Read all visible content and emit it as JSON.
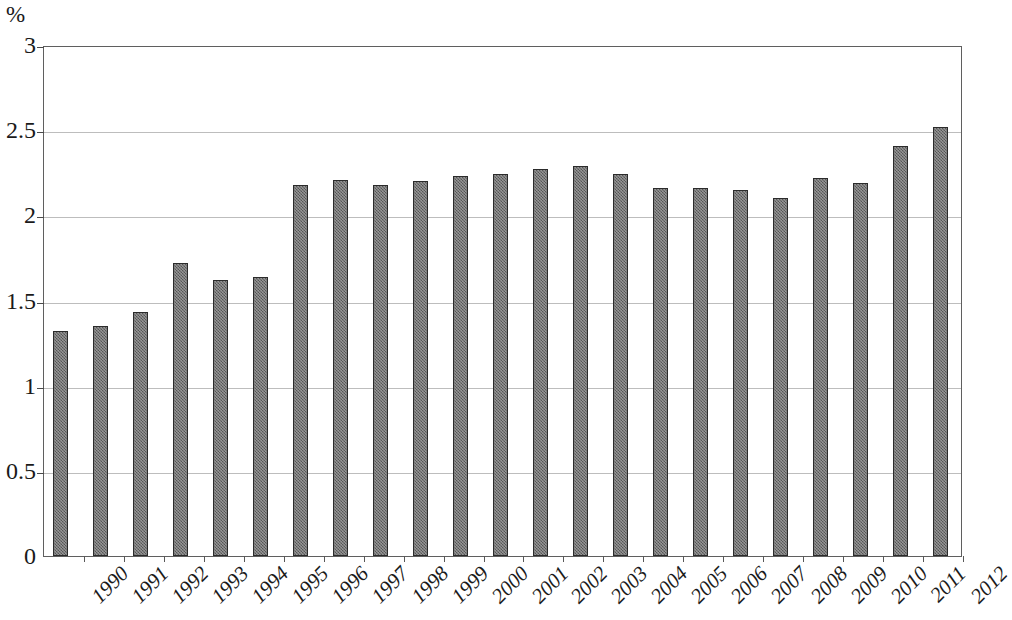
{
  "chart_data": {
    "type": "bar",
    "title": "",
    "subtitle": "",
    "xlabel": "",
    "ylabel": "%",
    "y_unit": "%",
    "ylim": [
      0,
      3
    ],
    "y_ticks": [
      "0",
      "0.5",
      "1",
      "1.5",
      "2",
      "2.5",
      "3"
    ],
    "y_tick_values": [
      0,
      0.5,
      1,
      1.5,
      2,
      2.5,
      3
    ],
    "grid": true,
    "grid_axis": "y",
    "legend": "none",
    "categories": [
      "1990",
      "1991",
      "1992",
      "1993",
      "1994",
      "1995",
      "1996",
      "1997",
      "1998",
      "1999",
      "2000",
      "2001",
      "2002",
      "2003",
      "2004",
      "2005",
      "2006",
      "2007",
      "2008",
      "2009",
      "2010",
      "2011",
      "2012"
    ],
    "values": [
      1.32,
      1.35,
      1.43,
      1.72,
      1.62,
      1.64,
      2.18,
      2.21,
      2.18,
      2.2,
      2.23,
      2.24,
      2.27,
      2.29,
      2.24,
      2.16,
      2.16,
      2.15,
      2.1,
      2.22,
      2.19,
      2.41,
      2.52
    ],
    "series": [
      {
        "name": "",
        "color": "#6e6e6e",
        "values": [
          1.32,
          1.35,
          1.43,
          1.72,
          1.62,
          1.64,
          2.18,
          2.21,
          2.18,
          2.2,
          2.23,
          2.24,
          2.27,
          2.29,
          2.24,
          2.16,
          2.16,
          2.15,
          2.1,
          2.22,
          2.19,
          2.41,
          2.52
        ]
      }
    ],
    "colors": {
      "bar_fill": "#6e6e6e",
      "bar_border": "#2b2b2b",
      "gridline": "#bdbdbd",
      "frame": "#5f5f5f",
      "text": "#1a1a1a",
      "background": "#ffffff"
    }
  }
}
